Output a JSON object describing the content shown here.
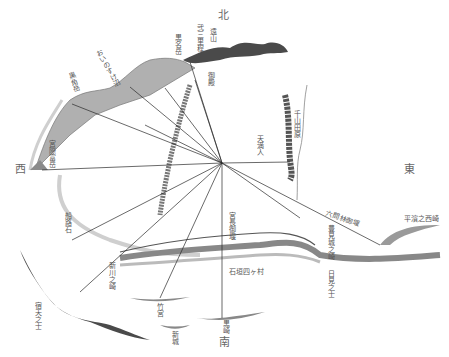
{
  "map": {
    "type": "sightline-survey-map",
    "hub": {
      "x": 222,
      "y": 163
    },
    "compass": {
      "north": "北",
      "south": "南",
      "east": "東",
      "west": "西"
    },
    "labels": {
      "touyama": "遠山",
      "sansan_ridge": "弐三里程",
      "kuromeidake": "黒名岳",
      "ushioike": "おいのすけ沼",
      "kurokadake": "黒角岳",
      "miyamoto": "宮際富岳",
      "funaishi": "船路石",
      "shinkawa": "新川之崎",
      "hoshiki": "宿天之士",
      "takemiya": "竹宮",
      "shinjou": "新城",
      "kurosaki": "黒崎",
      "ishizuka": "石垣四ヶ村",
      "miyanaga": "宮長御堰",
      "otemon": "六間林御堰",
      "hirasaki": "平濱之西崎",
      "toyomi": "豊見城之崎",
      "akari": "日見之士",
      "chiyama": "千山田原",
      "goten": "御殿",
      "tenma": "天満人"
    },
    "colors": {
      "ink": "#333333",
      "mountain_dark": "#4a4a4a",
      "mountain_light": "#a8a8a8",
      "coast": "#c8c8c8",
      "line": "#2a2a2a"
    }
  }
}
